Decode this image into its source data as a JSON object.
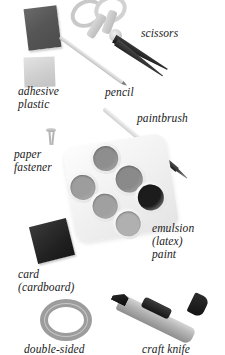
{
  "scene": {
    "title": "craft materials and tools",
    "background_color": "#ffffff",
    "style": "grayscale photographic illustration with italic serif labels"
  },
  "labels": [
    {
      "id": "scissors",
      "text": "scissors",
      "x": 141,
      "y": 27
    },
    {
      "id": "adhesive",
      "text": "adhesive",
      "x": 18,
      "y": 85
    },
    {
      "id": "plastic",
      "text": "plastic",
      "x": 18,
      "y": 98
    },
    {
      "id": "pencil",
      "text": "pencil",
      "x": 105,
      "y": 86
    },
    {
      "id": "paintbrush",
      "text": "paintbrush",
      "x": 137,
      "y": 112
    },
    {
      "id": "paper",
      "text": "paper",
      "x": 14,
      "y": 148
    },
    {
      "id": "fastener",
      "text": "fastener",
      "x": 14,
      "y": 161
    },
    {
      "id": "emulsion",
      "text": "emulsion",
      "x": 152,
      "y": 222
    },
    {
      "id": "latex",
      "text": "(latex)",
      "x": 152,
      "y": 235
    },
    {
      "id": "paint",
      "text": "paint",
      "x": 152,
      "y": 248
    },
    {
      "id": "card",
      "text": "card",
      "x": 18,
      "y": 268
    },
    {
      "id": "cardboard",
      "text": "(cardboard)",
      "x": 18,
      "y": 281
    },
    {
      "id": "doublesided",
      "text": "double-sided",
      "x": 24,
      "y": 343
    },
    {
      "id": "craftknife",
      "text": "craft knife",
      "x": 142,
      "y": 343
    }
  ],
  "objects": {
    "adhesive": {
      "name": "adhesive",
      "shape": "square",
      "color": "#565656"
    },
    "plastic": {
      "name": "plastic",
      "shape": "square",
      "color": "#cfcfcf"
    },
    "scissors": {
      "name": "scissors",
      "handle_color": "#cfcfcf",
      "blade_color": "#2a2a2a"
    },
    "pencil": {
      "name": "pencil",
      "color": "#d6d6d6",
      "tip_color": "#7e7e7e"
    },
    "paintbrush": {
      "name": "paintbrush",
      "handle_color": "#e2e2e2",
      "ferrule_color": "#1f1f1f"
    },
    "fastener": {
      "name": "paper fastener",
      "color": "#b4b4b4"
    },
    "palette": {
      "name": "emulsion (latex) paint palette",
      "tray_color": "#f1f1f1"
    },
    "card": {
      "name": "card (cardboard)",
      "shape": "square",
      "color": "#222222"
    },
    "tape": {
      "name": "double-sided tape",
      "shape": "ring",
      "color": "#9c9c9c"
    },
    "knife": {
      "name": "craft knife",
      "body_color": "#b3b3b3",
      "blade_color": "#0d0d0d"
    }
  },
  "palette_wells": [
    {
      "index": 0,
      "cx": 41,
      "cy": 16,
      "r": 12.5,
      "color": "#8e8e8e",
      "label": "well-1"
    },
    {
      "index": 1,
      "cx": 14,
      "cy": 41,
      "r": 12.5,
      "color": "#9d9d9d",
      "label": "well-2"
    },
    {
      "index": 2,
      "cx": 61,
      "cy": 40,
      "r": 13.5,
      "color": "#8a8a8a",
      "label": "well-3"
    },
    {
      "index": 3,
      "cx": 33,
      "cy": 63,
      "r": 12.5,
      "color": "#a0a0a0",
      "label": "well-4"
    },
    {
      "index": 4,
      "cx": 80,
      "cy": 62,
      "r": 13.0,
      "color": "#1c1c1c",
      "label": "well-5"
    },
    {
      "index": 5,
      "cx": 53,
      "cy": 84,
      "r": 12.5,
      "color": "#b0b0b0",
      "label": "well-6"
    }
  ]
}
